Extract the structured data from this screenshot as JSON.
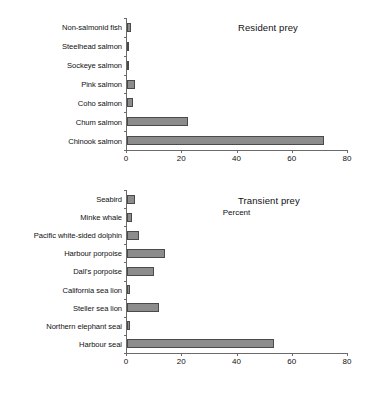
{
  "chart_data": [
    {
      "type": "bar",
      "orientation": "horizontal",
      "title": "Resident prey",
      "xlabel": "",
      "ylabel": "",
      "xlim": [
        0,
        80
      ],
      "xticks": [
        0,
        20,
        40,
        60,
        80
      ],
      "grid": false,
      "legend": "none",
      "categories": [
        "Non-salmonid fish",
        "Steelhead salmon",
        "Sockeye salmon",
        "Pink salmon",
        "Coho salmon",
        "Chum salmon",
        "Chinook salmon"
      ],
      "values": [
        1.5,
        0.4,
        0.4,
        2.8,
        2.2,
        22.0,
        71.5
      ]
    },
    {
      "type": "bar",
      "orientation": "horizontal",
      "title": "Transient prey",
      "xlabel": "Percent",
      "ylabel": "",
      "xlim": [
        0,
        80
      ],
      "xticks": [
        0,
        20,
        40,
        60,
        80
      ],
      "grid": false,
      "legend": "none",
      "categories": [
        "Seabird",
        "Minke whale",
        "Pacific white-sided dolphin",
        "Harbour porpoise",
        "Dall's porpoise",
        "California sea lion",
        "Steller sea lion",
        "Northern elephant seal",
        "Harbour seal"
      ],
      "values": [
        3.0,
        1.7,
        4.3,
        13.8,
        9.8,
        1.0,
        11.6,
        1.0,
        53.5
      ]
    }
  ],
  "axis": {
    "max": 80,
    "tick_labels": [
      "0",
      "20",
      "40",
      "60",
      "80"
    ]
  },
  "colors": {
    "bar_fill": "#8c8c8c",
    "bar_border": "#4a4a4a",
    "axis": "#6a6a6a",
    "text": "#111111",
    "background": "#ffffff"
  }
}
